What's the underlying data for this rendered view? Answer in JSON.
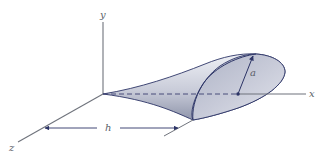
{
  "figure": {
    "axes": {
      "x_label": "x",
      "y_label": "y",
      "z_label": "z"
    },
    "dimensions": {
      "length_label": "h",
      "radius_label": "a"
    },
    "colors": {
      "axis": "#6f737c",
      "surface_light": "#e4e7ef",
      "surface_dark": "#9aa0b4",
      "outline": "#2c3466",
      "arrow": "#2c3466",
      "dashed_axis": "#3a4070"
    }
  }
}
